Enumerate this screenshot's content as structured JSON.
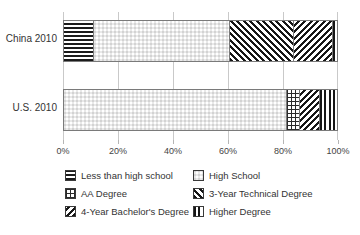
{
  "chart_data": {
    "type": "bar",
    "orientation": "horizontal",
    "stacked": true,
    "percent": true,
    "title": "",
    "xlabel": "",
    "ylabel": "",
    "categories": [
      "China 2010",
      "U.S. 2010"
    ],
    "xlim": [
      0,
      100
    ],
    "xticks": [
      0,
      20,
      40,
      60,
      80,
      100
    ],
    "xtick_labels": [
      "0%",
      "20%",
      "40%",
      "60%",
      "80%",
      "100%"
    ],
    "grid": true,
    "legend_position": "bottom",
    "series": [
      {
        "name": "Less than high school",
        "pattern": "horizontal-lines",
        "values": [
          10.5,
          0
        ]
      },
      {
        "name": "High School",
        "pattern": "checkerboard",
        "values": [
          50.0,
          81.5
        ]
      },
      {
        "name": "AA Degree",
        "pattern": "fine-grid",
        "values": [
          0,
          4.5
        ]
      },
      {
        "name": "3-Year Technical Degree",
        "pattern": "diagonal-forward",
        "values": [
          23.5,
          0
        ]
      },
      {
        "name": "4-Year Bachelor's Degree",
        "pattern": "diagonal-back",
        "values": [
          14.0,
          7.5
        ]
      },
      {
        "name": "Higher Degree",
        "pattern": "vertical-lines",
        "values": [
          2.0,
          6.5
        ]
      }
    ]
  },
  "axis": {
    "ticks": [
      {
        "label": "0%",
        "value": 0
      },
      {
        "label": "20%",
        "value": 20
      },
      {
        "label": "40%",
        "value": 40
      },
      {
        "label": "60%",
        "value": 60
      },
      {
        "label": "80%",
        "value": 80
      },
      {
        "label": "100%",
        "value": 100
      }
    ]
  },
  "bars": {
    "china": {
      "label": "China 2010",
      "segments": [
        {
          "series": "Less than high school",
          "value": 10.5
        },
        {
          "series": "High School",
          "value": 50.0
        },
        {
          "series": "3-Year Technical Degree",
          "value": 23.5
        },
        {
          "series": "4-Year Bachelor's Degree",
          "value": 14.0
        },
        {
          "series": "Higher Degree",
          "value": 2.0
        }
      ]
    },
    "us": {
      "label": "U.S. 2010",
      "segments": [
        {
          "series": "High School",
          "value": 81.5
        },
        {
          "series": "AA Degree",
          "value": 4.5
        },
        {
          "series": "4-Year Bachelor's Degree",
          "value": 7.5
        },
        {
          "series": "Higher Degree",
          "value": 6.5
        }
      ]
    }
  },
  "legend": {
    "rows": [
      [
        {
          "label": "Less than high school"
        },
        {
          "label": "High School"
        }
      ],
      [
        {
          "label": "AA Degree"
        },
        {
          "label": "3-Year Technical Degree"
        }
      ],
      [
        {
          "label": "4-Year Bachelor's Degree"
        },
        {
          "label": "Higher Degree"
        }
      ]
    ]
  },
  "colors": {
    "ink": "#161616",
    "background": "#ffffff",
    "gridline": "#c9c9c9",
    "bar_border": "#7a7a7a",
    "text": "#333333"
  }
}
